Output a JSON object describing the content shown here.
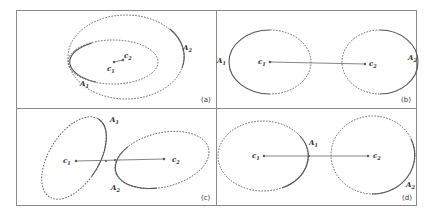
{
  "figure": {
    "panels": [
      {
        "tag": "(a)",
        "labels": {
          "c1": "c",
          "c1_sub": "1",
          "c2": "c",
          "c2_sub": "2",
          "A1": "A",
          "A1_sub": "1",
          "A2": "A",
          "A2_sub": "2"
        },
        "relation": "nested ellipses"
      },
      {
        "tag": "(b)",
        "labels": {
          "c1": "c",
          "c1_sub": "1",
          "c2": "c",
          "c2_sub": "2",
          "A1": "A",
          "A1_sub": "1",
          "A2": "A",
          "A2_sub": "2"
        },
        "relation": "separate ellipses"
      },
      {
        "tag": "(c)",
        "labels": {
          "c1": "c",
          "c1_sub": "1",
          "c2": "c",
          "c2_sub": "2",
          "A1": "A",
          "A1_sub": "1",
          "A2": "A",
          "A2_sub": "2"
        },
        "relation": "touching rotated ellipses"
      },
      {
        "tag": "(d)",
        "labels": {
          "c1": "c",
          "c1_sub": "1",
          "c2": "c",
          "c2_sub": "2",
          "A1": "A",
          "A1_sub": "1",
          "A2": "A",
          "A2_sub": "2"
        },
        "relation": "tangent ellipses"
      }
    ]
  },
  "colors": {
    "frame": "#8a8a8a",
    "curve": "#555555",
    "text": "#333333"
  }
}
